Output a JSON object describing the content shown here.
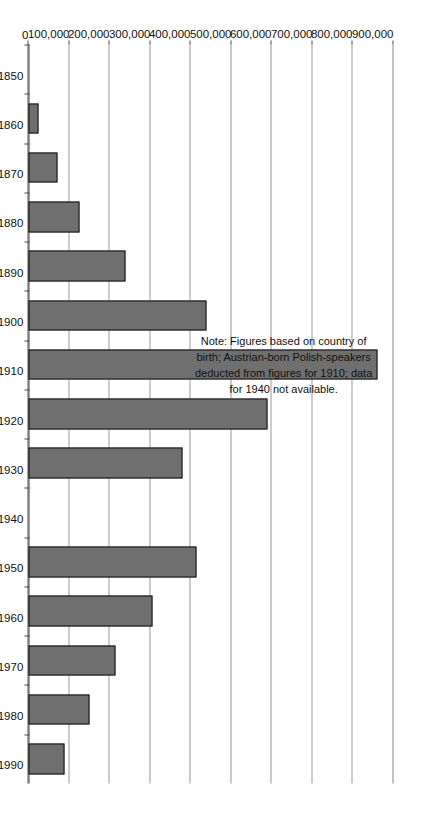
{
  "chart_data": {
    "type": "bar",
    "title": "",
    "subtitle": "",
    "xlabel": "",
    "ylabel": "",
    "orientation": "vertical-rotated-90",
    "grid": true,
    "legend": false,
    "categories": [
      "1850",
      "1860",
      "1870",
      "1880",
      "1890",
      "1900",
      "1910",
      "1920",
      "1930",
      "1940",
      "1950",
      "1960",
      "1970",
      "1980",
      "1990"
    ],
    "values": [
      0,
      25000,
      72000,
      125000,
      240000,
      440000,
      860000,
      590000,
      380000,
      null,
      415000,
      305000,
      215000,
      150000,
      90000
    ],
    "ylim": [
      0,
      900000
    ],
    "ytick_labels": [
      "900,000",
      "800,000",
      "700,000",
      "600,000",
      "500,000",
      "400,000",
      "300,000",
      "200,000",
      "100,000",
      "0"
    ],
    "ytick_values": [
      900000,
      800000,
      700000,
      600000,
      500000,
      400000,
      300000,
      200000,
      100000,
      0
    ],
    "xtick_labels": [
      "1850",
      "1860",
      "1870",
      "1880",
      "1890",
      "1900",
      "1910",
      "1920",
      "1930",
      "1940",
      "1950",
      "1960",
      "1970",
      "1980",
      "1990"
    ],
    "missing_categories": [
      "1940"
    ],
    "annotations": [
      "Note: Figures based on country of birth; Austrian-born Polish-speakers deducted from figures for 1910; data for 1940 not available."
    ],
    "colors": {
      "bar_fill": "#6f6f6f",
      "bar_border": "#101010",
      "gridline": "#9a9a9a",
      "axis": "#4a4a4a",
      "text": "#111111",
      "background": "#ffffff"
    }
  },
  "note": {
    "line1": "Note: Figures based on country of",
    "line2": "birth; Austrian-born Polish-speakers",
    "line3": "deducted from figures for 1910; data",
    "line4": "for 1940 not available."
  }
}
